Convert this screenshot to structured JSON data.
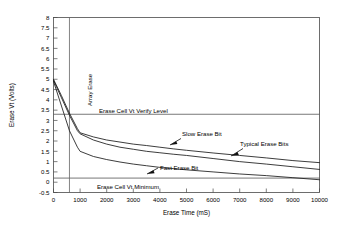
{
  "chart_data": {
    "type": "line",
    "title": "",
    "xlabel": "Erase Time (mS)",
    "ylabel": "Erase Vt (Volts)",
    "xlim": [
      0,
      10000
    ],
    "ylim": [
      -0.5,
      8
    ],
    "xticks": [
      0,
      1000,
      2000,
      3000,
      4000,
      5000,
      6000,
      7000,
      8000,
      9000,
      10000
    ],
    "yticks": [
      -0.5,
      0,
      0.5,
      1,
      1.5,
      2,
      2.5,
      3,
      3.5,
      4,
      4.5,
      5,
      5.5,
      6,
      6.5,
      7,
      7.5,
      8
    ],
    "xtick_labels": [
      "0",
      "1000",
      "2000",
      "3000",
      "4000",
      "5000",
      "6000",
      "7000",
      "8000",
      "9000",
      "10000"
    ],
    "ytick_labels": [
      "-0.5",
      "0",
      "0.5",
      "1",
      "1.5",
      "2",
      "2.5",
      "3",
      "3.5",
      "4",
      "4.5",
      "5",
      "5.5",
      "6",
      "6.5",
      "7",
      "7.5",
      "8"
    ],
    "grid": false,
    "legend": "none",
    "series": [
      {
        "name": "Slow Erase Bit",
        "x": [
          0,
          300,
          600,
          900,
          1000,
          1500,
          2000,
          2500,
          3000,
          3500,
          4000,
          4500,
          5000,
          6000,
          7000,
          8000,
          9000,
          10000
        ],
        "y": [
          5.0,
          4.2,
          3.35,
          2.6,
          2.4,
          2.2,
          2.05,
          1.95,
          1.85,
          1.78,
          1.7,
          1.62,
          1.55,
          1.42,
          1.3,
          1.18,
          1.05,
          0.95
        ]
      },
      {
        "name": "Typical Erase Bits",
        "x": [
          0,
          300,
          600,
          900,
          1000,
          1500,
          2000,
          2500,
          3000,
          3500,
          4000,
          4500,
          5000,
          6000,
          7000,
          8000,
          9000,
          10000
        ],
        "y": [
          4.95,
          4.1,
          3.25,
          2.5,
          2.35,
          2.05,
          1.85,
          1.7,
          1.6,
          1.5,
          1.43,
          1.36,
          1.3,
          1.15,
          1.0,
          0.88,
          0.75,
          0.62
        ]
      },
      {
        "name": "Fast Erase Bit",
        "x": [
          0,
          300,
          600,
          900,
          1000,
          1500,
          2000,
          2500,
          3000,
          3500,
          4000,
          4500,
          5000,
          6000,
          7000,
          8000,
          9000,
          10000
        ],
        "y": [
          4.9,
          3.7,
          2.5,
          1.7,
          1.5,
          1.25,
          1.1,
          0.98,
          0.88,
          0.8,
          0.72,
          0.66,
          0.6,
          0.5,
          0.4,
          0.32,
          0.22,
          0.12
        ]
      }
    ],
    "reference_lines": [
      {
        "name": "Erase Cell Vt Verify Level",
        "orientation": "horizontal",
        "value": 3.3,
        "label": "Erase Cell Vt Verify Level"
      },
      {
        "name": "Erase Cell Vt Minimum",
        "orientation": "horizontal",
        "value": 0.2,
        "label": "Erase Cell Vt Minimum"
      },
      {
        "name": "Array Erase",
        "orientation": "vertical",
        "value": 600,
        "label": "Array Erase"
      }
    ],
    "annotations": [
      {
        "text": "Array Erase",
        "rotation": -90
      },
      {
        "text": "Erase Cell Vt Verify Level"
      },
      {
        "text": "Erase Cell Vt Minimum"
      },
      {
        "text": "Slow Erase Bit"
      },
      {
        "text": "Typical Erase Bits"
      },
      {
        "text": "Fast Erase Bit"
      }
    ],
    "colors": {
      "series": "#1a1a1a",
      "frame": "#4a4a4a",
      "reference": "#555555",
      "background": "#ffffff"
    }
  }
}
